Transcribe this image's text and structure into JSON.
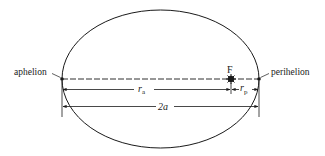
{
  "diagram": {
    "labels": {
      "aphelion": "aphelion",
      "perihelion": "perihelion",
      "focus": "F",
      "r_a": "r",
      "r_a_sub": "a",
      "r_p": "r",
      "r_p_sub": "p",
      "major_axis": "2a"
    },
    "colors": {
      "stroke": "#1a1a1a",
      "background": "#ffffff"
    }
  }
}
